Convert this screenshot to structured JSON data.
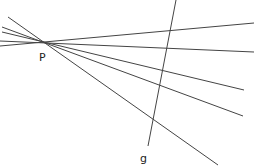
{
  "diagram": {
    "point": {
      "label": "P",
      "x": 43,
      "y": 44,
      "label_x": 39,
      "label_y": 61
    },
    "line_g": {
      "label": "g",
      "x1": 176,
      "y1": 0,
      "x2": 148,
      "y2": 146,
      "label_x": 140,
      "label_y": 162
    },
    "pencil_lines": [
      {
        "x1": 0,
        "y1": 46,
        "x2": 254,
        "y2": 23
      },
      {
        "x1": 0,
        "y1": 41,
        "x2": 254,
        "y2": 52
      },
      {
        "x1": 2,
        "y1": 32,
        "x2": 244,
        "y2": 90
      },
      {
        "x1": 2,
        "y1": 27,
        "x2": 243,
        "y2": 116
      },
      {
        "x1": 8,
        "y1": 17,
        "x2": 218,
        "y2": 165
      }
    ],
    "colors": {
      "line": "#444444",
      "text": "#222222",
      "background": "#ffffff"
    }
  }
}
